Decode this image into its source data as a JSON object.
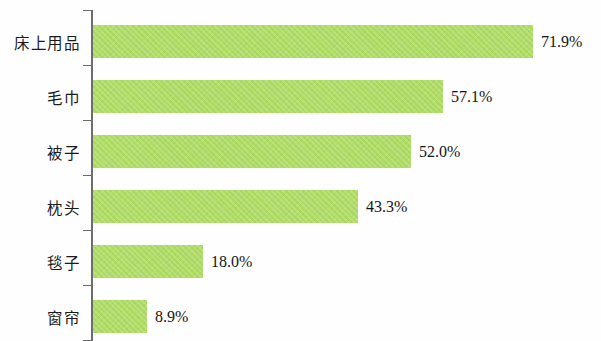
{
  "chart_data": {
    "type": "bar",
    "orientation": "horizontal",
    "title": "",
    "subtitle": "",
    "xlabel": "",
    "ylabel": "",
    "categories": [
      "床上用品",
      "毛巾",
      "被子",
      "枕头",
      "毯子",
      "窗帘"
    ],
    "values": [
      71.9,
      57.1,
      52.0,
      43.3,
      18.0,
      8.9
    ],
    "value_labels": [
      "71.9%",
      "57.1%",
      "52.0%",
      "43.3%",
      "18.0%",
      "8.9%"
    ],
    "xlim": [
      0,
      81
    ],
    "grid": false,
    "legend": [],
    "legend_position": "none",
    "series": [
      {
        "name": "",
        "values": [
          71.9,
          57.1,
          52.0,
          43.3,
          18.0,
          8.9
        ]
      }
    ],
    "colors": {
      "bar": "#aedc62",
      "axis": "#6d6d6d",
      "text": "#141414",
      "background": "#ffffff"
    }
  },
  "bars": [
    {
      "category": "床上用品",
      "value": 71.9,
      "label": "71.9%"
    },
    {
      "category": "毛巾",
      "value": 57.1,
      "label": "57.1%"
    },
    {
      "category": "被子",
      "value": 52.0,
      "label": "52.0%"
    },
    {
      "category": "枕头",
      "value": 43.3,
      "label": "43.3%"
    },
    {
      "category": "毯子",
      "value": 18.0,
      "label": "18.0%"
    },
    {
      "category": "窗帘",
      "value": 8.9,
      "label": "8.9%"
    }
  ]
}
